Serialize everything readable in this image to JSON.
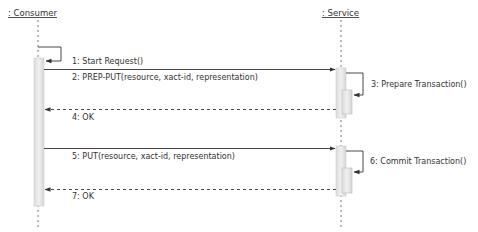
{
  "participants": [
    {
      "id": "consumer",
      "label": ": Consumer"
    },
    {
      "id": "service",
      "label": ": Service"
    }
  ],
  "messages": [
    {
      "id": "m1",
      "label": "1: Start Request()",
      "from": "consumer",
      "to": "consumer",
      "kind": "self"
    },
    {
      "id": "m2",
      "label": "2: PREP-PUT(resource, xact-id, representation)",
      "from": "consumer",
      "to": "service",
      "kind": "sync"
    },
    {
      "id": "m3",
      "label": "3: Prepare Transaction()",
      "from": "service",
      "to": "service",
      "kind": "self"
    },
    {
      "id": "m4",
      "label": "4: OK",
      "from": "service",
      "to": "consumer",
      "kind": "return"
    },
    {
      "id": "m5",
      "label": "5: PUT(resource, xact-id, representation)",
      "from": "consumer",
      "to": "service",
      "kind": "sync"
    },
    {
      "id": "m6",
      "label": "6: Commit Transaction()",
      "from": "service",
      "to": "service",
      "kind": "self"
    },
    {
      "id": "m7",
      "label": "7: OK",
      "from": "service",
      "to": "consumer",
      "kind": "return"
    }
  ],
  "colors": {
    "line": "#333333",
    "lifeline": "#777777",
    "activation_fill": "#e6e6e6",
    "activation_edge": "#c8c8c8"
  }
}
